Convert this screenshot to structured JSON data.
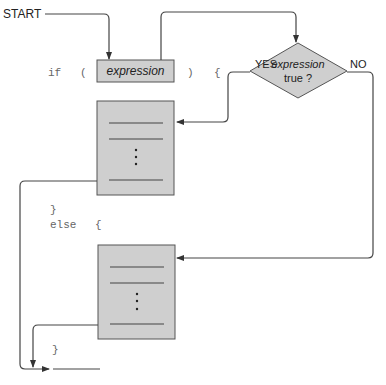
{
  "diagram": {
    "start_label": "START",
    "code": {
      "if_keyword": "if",
      "open_paren": "(",
      "close_paren": ")",
      "open_brace": "{",
      "close_brace_1": "}",
      "else_keyword": "else",
      "else_brace": "{",
      "close_brace_2": "}"
    },
    "expression_box": {
      "label": "expression"
    },
    "decision": {
      "line1": "expression",
      "line2": "true ?"
    },
    "branch_labels": {
      "yes": "YES",
      "no": "NO"
    },
    "colors": {
      "box_fill": "#cfcfcf",
      "stroke": "#555555",
      "line": "#444444",
      "code_text": "#666666"
    }
  }
}
